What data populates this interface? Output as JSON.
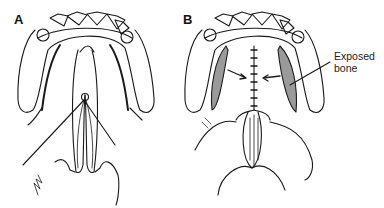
{
  "figure": {
    "panels": [
      {
        "label": "A",
        "description": "palate with cleft and sutures through flaps"
      },
      {
        "label": "B",
        "description": "closed midline suture with arrows and exposed bone lateral"
      }
    ],
    "annotations": [
      {
        "line1": "Exposed",
        "line2": "bone"
      }
    ],
    "colors": {
      "stroke": "#1a1a1a",
      "shade": "#9a9a9a",
      "background": "#ffffff"
    }
  }
}
